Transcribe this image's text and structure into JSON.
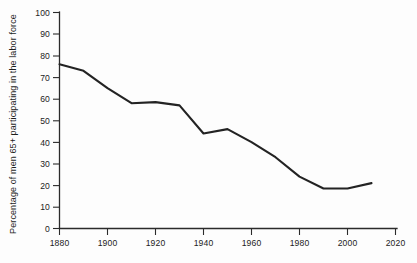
{
  "chart_data": {
    "type": "line",
    "title": "",
    "xlabel": "",
    "ylabel": "Percentage of men 65+ participating in the labor force",
    "xlim": [
      1880,
      2020
    ],
    "ylim": [
      0,
      100
    ],
    "grid": false,
    "legend": "none",
    "xticks": [
      "1880",
      "1900",
      "1920",
      "1940",
      "1960",
      "1980",
      "2000",
      "2020"
    ],
    "xtick_values": [
      1880,
      1900,
      1920,
      1940,
      1960,
      1980,
      2000,
      2020
    ],
    "yticks": [
      "0",
      "10",
      "20",
      "30",
      "40",
      "50",
      "60",
      "70",
      "80",
      "90",
      "100"
    ],
    "ytick_values": [
      0,
      10,
      20,
      30,
      40,
      50,
      60,
      70,
      80,
      90,
      100
    ],
    "x": [
      1880,
      1890,
      1900,
      1910,
      1920,
      1930,
      1940,
      1950,
      1960,
      1970,
      1980,
      1990,
      2000,
      2010
    ],
    "values": [
      76,
      73,
      65,
      58,
      58.5,
      57,
      44,
      46,
      40,
      33,
      24,
      18.5,
      18.5,
      21
    ],
    "series": [
      {
        "name": "Percentage of men 65+ participating in the labor force",
        "color": "#232323",
        "values": [
          76,
          73,
          65,
          58,
          58.5,
          57,
          44,
          46,
          40,
          33,
          24,
          18.5,
          18.5,
          21
        ]
      }
    ]
  },
  "axes": {
    "y_title": "Percentage of men 65+ participating in the labor force",
    "y_labels": [
      "100",
      "90",
      "80",
      "70",
      "60",
      "50",
      "40",
      "30",
      "20",
      "10",
      "0"
    ],
    "x_labels": [
      "1880",
      "1900",
      "1920",
      "1940",
      "1960",
      "1980",
      "2000",
      "2020"
    ]
  },
  "colors": {
    "line": "#232323",
    "axis": "#2b2b2b",
    "background": "#fdfdfd",
    "text": "#1d1d1d"
  }
}
